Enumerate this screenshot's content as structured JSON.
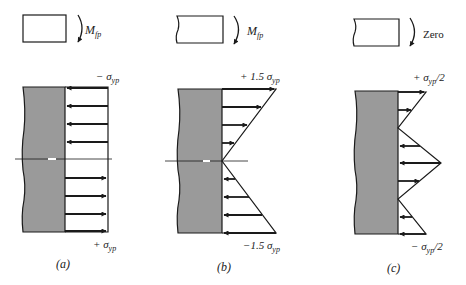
{
  "colors": {
    "stroke": "#1a1a1a",
    "beam_fill": "#9a9a9a",
    "background": "#ffffff"
  },
  "panels": [
    {
      "id": "a",
      "caption": "(a)",
      "moment_label": "M",
      "moment_subscript": "fp",
      "top_label": "− σ",
      "top_label_sub": "yp",
      "top_label_suffix": "",
      "bottom_label": "+ σ",
      "bottom_label_sub": "yp",
      "bottom_label_suffix": "",
      "distribution": "fully plastic (uniform, rectangular)"
    },
    {
      "id": "b",
      "caption": "(b)",
      "moment_label": "M",
      "moment_subscript": "fp",
      "top_label": "+ 1.5 σ",
      "top_label_sub": "yp",
      "top_label_suffix": "",
      "bottom_label": "−1.5 σ",
      "bottom_label_sub": "yp",
      "bottom_label_suffix": "",
      "distribution": "elastic unloading (linear, triangular)"
    },
    {
      "id": "c",
      "caption": "(c)",
      "moment_label": "Zero",
      "moment_subscript": "",
      "top_label": "+ σ",
      "top_label_sub": "yp",
      "top_label_suffix": "/2",
      "bottom_label": "− σ",
      "bottom_label_sub": "yp",
      "bottom_label_suffix": "/2",
      "distribution": "residual stress (zig-zag)"
    }
  ]
}
